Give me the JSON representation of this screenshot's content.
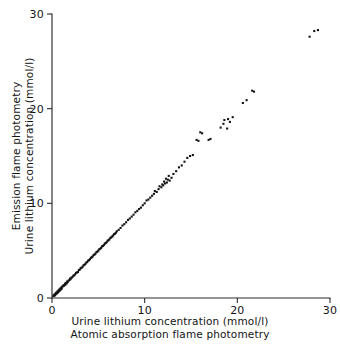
{
  "figure": {
    "background_color": "#ffffff",
    "ink_color": "#141414"
  },
  "axes": {
    "x": {
      "title_line1": "Urine lithium concentration (mmol/l)",
      "title_line2": "Atomic absorption flame photometry",
      "ticks": [
        "0",
        "10",
        "20",
        "30"
      ],
      "tick_values": [
        0,
        10,
        20,
        30
      ],
      "range": [
        0,
        30
      ]
    },
    "y": {
      "title_line1": "Emission flame photometry",
      "title_line2": "Urine lithium concentration (mmol/l)",
      "ticks": [
        "0",
        "10",
        "20",
        "30"
      ],
      "tick_values": [
        0,
        10,
        20,
        30
      ],
      "range": [
        0,
        30
      ]
    }
  },
  "chart_data": {
    "type": "scatter",
    "title": "",
    "xlabel": "Urine lithium concentration (mmol/l) — Atomic absorption flame photometry",
    "ylabel": "Emission flame photometry — Urine lithium concentration (mmol/l)",
    "xlim": [
      0,
      30
    ],
    "ylim": [
      0,
      30
    ],
    "xticks": [
      0,
      10,
      20,
      30
    ],
    "yticks": [
      0,
      10,
      20,
      30
    ],
    "grid": false,
    "legend": null,
    "marker": "square-dot",
    "marker_size_px": 2.1,
    "marker_color": "#141414",
    "series": [
      {
        "name": "Urine lithium paired measurements",
        "points": [
          [
            0.15,
            0.2
          ],
          [
            0.2,
            0.3
          ],
          [
            0.25,
            0.25
          ],
          [
            0.3,
            0.4
          ],
          [
            0.35,
            0.3
          ],
          [
            0.4,
            0.5
          ],
          [
            0.45,
            0.45
          ],
          [
            0.5,
            0.6
          ],
          [
            0.55,
            0.5
          ],
          [
            0.6,
            0.7
          ],
          [
            0.65,
            0.6
          ],
          [
            0.7,
            0.8
          ],
          [
            0.75,
            0.7
          ],
          [
            0.8,
            0.9
          ],
          [
            0.85,
            0.8
          ],
          [
            0.9,
            1.0
          ],
          [
            0.95,
            0.9
          ],
          [
            1.0,
            1.1
          ],
          [
            1.05,
            1.0
          ],
          [
            1.1,
            1.2
          ],
          [
            1.2,
            1.25
          ],
          [
            1.25,
            1.35
          ],
          [
            1.3,
            1.3
          ],
          [
            1.4,
            1.5
          ],
          [
            1.45,
            1.4
          ],
          [
            1.5,
            1.6
          ],
          [
            1.6,
            1.55
          ],
          [
            1.65,
            1.75
          ],
          [
            1.7,
            1.7
          ],
          [
            1.8,
            1.85
          ],
          [
            1.9,
            1.9
          ],
          [
            1.95,
            2.05
          ],
          [
            2.0,
            2.0
          ],
          [
            2.1,
            2.15
          ],
          [
            2.2,
            2.2
          ],
          [
            2.3,
            2.35
          ],
          [
            2.4,
            2.4
          ],
          [
            2.5,
            2.5
          ],
          [
            2.6,
            2.65
          ],
          [
            2.7,
            2.7
          ],
          [
            2.8,
            2.75
          ],
          [
            2.9,
            2.95
          ],
          [
            3.0,
            3.0
          ],
          [
            3.1,
            3.15
          ],
          [
            3.2,
            3.2
          ],
          [
            3.3,
            3.3
          ],
          [
            3.4,
            3.45
          ],
          [
            3.5,
            3.5
          ],
          [
            3.6,
            3.6
          ],
          [
            3.7,
            3.75
          ],
          [
            3.8,
            3.8
          ],
          [
            3.9,
            3.95
          ],
          [
            4.0,
            4.0
          ],
          [
            4.1,
            4.1
          ],
          [
            4.2,
            4.25
          ],
          [
            4.3,
            4.3
          ],
          [
            4.4,
            4.4
          ],
          [
            4.5,
            4.55
          ],
          [
            4.6,
            4.6
          ],
          [
            4.7,
            4.7
          ],
          [
            4.8,
            4.85
          ],
          [
            4.9,
            4.9
          ],
          [
            5.0,
            5.0
          ],
          [
            5.1,
            5.15
          ],
          [
            5.2,
            5.2
          ],
          [
            5.3,
            5.3
          ],
          [
            5.4,
            5.45
          ],
          [
            5.5,
            5.5
          ],
          [
            5.6,
            5.6
          ],
          [
            5.7,
            5.75
          ],
          [
            5.8,
            5.8
          ],
          [
            5.9,
            5.9
          ],
          [
            6.0,
            6.05
          ],
          [
            6.1,
            6.1
          ],
          [
            6.2,
            6.2
          ],
          [
            6.3,
            6.35
          ],
          [
            6.4,
            6.4
          ],
          [
            6.5,
            6.5
          ],
          [
            6.6,
            6.6
          ],
          [
            6.7,
            6.75
          ],
          [
            6.8,
            6.8
          ],
          [
            6.9,
            6.9
          ],
          [
            7.0,
            7.05
          ],
          [
            7.2,
            7.2
          ],
          [
            7.4,
            7.4
          ],
          [
            7.6,
            7.65
          ],
          [
            7.8,
            7.8
          ],
          [
            8.0,
            8.0
          ],
          [
            8.2,
            8.25
          ],
          [
            8.4,
            8.4
          ],
          [
            8.6,
            8.6
          ],
          [
            8.8,
            8.8
          ],
          [
            9.0,
            9.05
          ],
          [
            9.2,
            9.2
          ],
          [
            9.4,
            9.4
          ],
          [
            9.6,
            9.55
          ],
          [
            9.8,
            9.8
          ],
          [
            10.0,
            10.0
          ],
          [
            10.2,
            10.3
          ],
          [
            10.4,
            10.4
          ],
          [
            10.6,
            10.6
          ],
          [
            10.8,
            10.8
          ],
          [
            11.0,
            11.0
          ],
          [
            11.1,
            11.3
          ],
          [
            11.3,
            11.2
          ],
          [
            11.5,
            11.5
          ],
          [
            11.6,
            11.8
          ],
          [
            11.8,
            11.7
          ],
          [
            11.9,
            12.0
          ],
          [
            12.0,
            11.9
          ],
          [
            12.1,
            12.3
          ],
          [
            12.2,
            12.1
          ],
          [
            12.3,
            12.6
          ],
          [
            12.4,
            12.2
          ],
          [
            12.5,
            12.5
          ],
          [
            12.6,
            12.9
          ],
          [
            12.7,
            12.4
          ],
          [
            12.9,
            12.7
          ],
          [
            13.1,
            13.1
          ],
          [
            13.4,
            13.4
          ],
          [
            13.7,
            13.8
          ],
          [
            14.0,
            14.0
          ],
          [
            14.3,
            14.4
          ],
          [
            14.6,
            14.8
          ],
          [
            14.9,
            15.0
          ],
          [
            15.2,
            15.1
          ],
          [
            15.6,
            16.7
          ],
          [
            15.8,
            16.6
          ],
          [
            16.0,
            17.5
          ],
          [
            16.2,
            17.4
          ],
          [
            16.9,
            16.7
          ],
          [
            17.1,
            16.8
          ],
          [
            18.2,
            18.0
          ],
          [
            18.5,
            18.4
          ],
          [
            18.6,
            18.8
          ],
          [
            18.9,
            17.9
          ],
          [
            19.0,
            18.9
          ],
          [
            19.2,
            18.6
          ],
          [
            19.5,
            19.1
          ],
          [
            20.6,
            20.6
          ],
          [
            21.0,
            20.9
          ],
          [
            21.6,
            21.9
          ],
          [
            21.8,
            21.8
          ],
          [
            27.8,
            27.6
          ],
          [
            28.3,
            28.2
          ],
          [
            28.7,
            28.3
          ]
        ]
      }
    ]
  }
}
